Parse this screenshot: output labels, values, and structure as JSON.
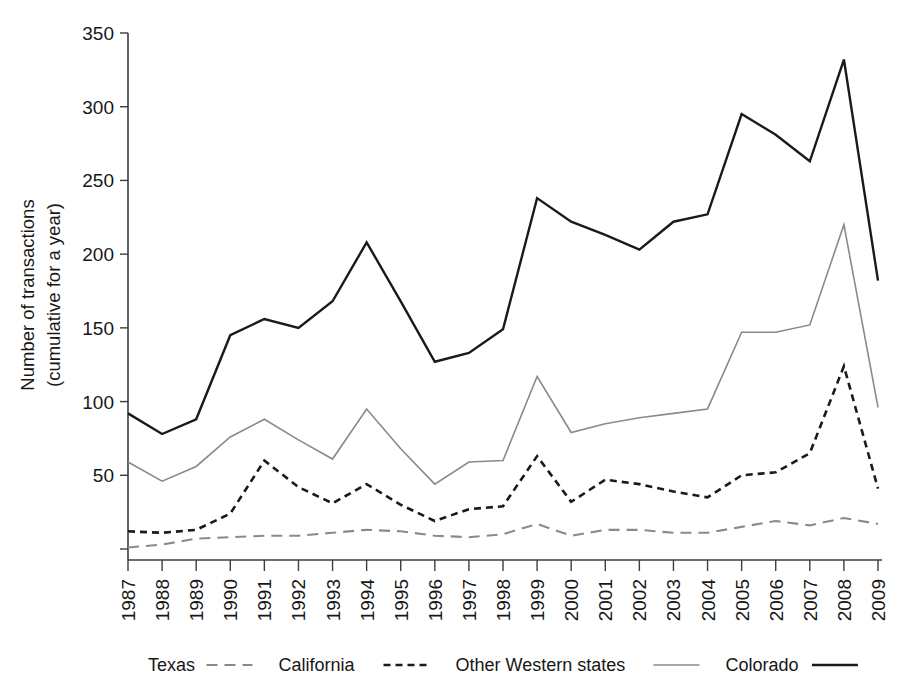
{
  "chart_data": {
    "type": "line",
    "title": "",
    "xlabel": "",
    "ylabel": "Number of transactions",
    "ylabel_line2": "(cumulative for a year)",
    "ylim": [
      0,
      350
    ],
    "ytick_step": 50,
    "yticks": [
      0,
      50,
      100,
      150,
      200,
      250,
      300,
      350
    ],
    "ytick_labels": [
      "",
      "50",
      "100",
      "150",
      "200",
      "250",
      "300",
      "350"
    ],
    "grid": false,
    "legend_position": "bottom",
    "categories": [
      "1987",
      "1988",
      "1989",
      "1990",
      "1991",
      "1992",
      "1993",
      "1994",
      "1995",
      "1996",
      "1997",
      "1998",
      "1999",
      "2000",
      "2001",
      "2002",
      "2003",
      "2004",
      "2005",
      "2006",
      "2007",
      "2008",
      "2009"
    ],
    "series": [
      {
        "name": "Texas",
        "style": "long-dash",
        "color": "#8a8a8a",
        "width": 2.1,
        "dasharray": "11,7",
        "legend_sample": "- - -",
        "values": [
          1,
          3,
          7,
          8,
          9,
          9,
          11,
          13,
          12,
          9,
          8,
          10,
          17,
          9,
          13,
          13,
          11,
          11,
          15,
          19,
          16,
          21,
          17
        ]
      },
      {
        "name": "California",
        "style": "dashed",
        "color": "#1a1a1a",
        "width": 2.6,
        "dasharray": "7,5",
        "legend_sample": "- - - - -",
        "values": [
          12,
          11,
          13,
          24,
          60,
          42,
          31,
          44,
          30,
          19,
          27,
          29,
          63,
          32,
          47,
          44,
          39,
          35,
          50,
          52,
          65,
          124,
          41
        ]
      },
      {
        "name": "Other Western states",
        "style": "thin-solid",
        "color": "#8a8a8a",
        "width": 1.6,
        "dasharray": "",
        "legend_sample": "——",
        "values": [
          59,
          46,
          56,
          76,
          88,
          74,
          61,
          95,
          68,
          44,
          59,
          60,
          117,
          79,
          85,
          89,
          92,
          95,
          147,
          147,
          152,
          220,
          96
        ]
      },
      {
        "name": "Colorado",
        "style": "thick-solid",
        "color": "#1a1a1a",
        "width": 2.4,
        "dasharray": "",
        "legend_sample": "——",
        "values": [
          92,
          78,
          88,
          145,
          156,
          150,
          168,
          208,
          168,
          127,
          133,
          149,
          238,
          222,
          213,
          203,
          222,
          227,
          295,
          281,
          263,
          332,
          182
        ]
      }
    ]
  },
  "legend": {
    "items": [
      {
        "label": "Texas"
      },
      {
        "label": "California"
      },
      {
        "label": "Other Western states"
      },
      {
        "label": "Colorado"
      }
    ]
  }
}
